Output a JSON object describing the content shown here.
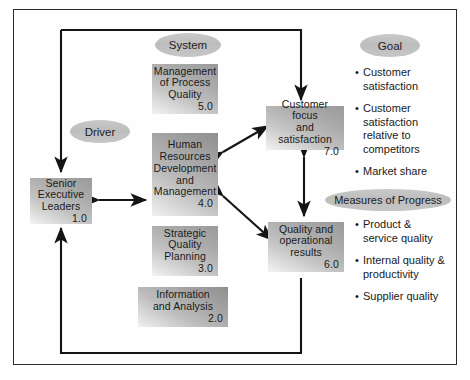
{
  "diagram": {
    "frame_border_color": "#2b2b2b",
    "box_fill": "#b0b0b0",
    "ellipse_fill": "#c2c2c2",
    "line_color": "#1a1a1a"
  },
  "labels": {
    "driver": "Driver",
    "system": "System",
    "goal": "Goal",
    "measures": "Measures of Progress"
  },
  "boxes": [
    {
      "id": "senior-executive-leaders",
      "title": "Senior\nExecutive\nLeaders",
      "lines": [
        "Senior",
        "Executive",
        "Leaders"
      ],
      "number": "1.0"
    },
    {
      "id": "management-of-process-quality",
      "lines": [
        "Management",
        "of Process",
        "Quality"
      ],
      "number": "5.0"
    },
    {
      "id": "human-resources-development-and-management",
      "lines": [
        "Human",
        "Resources",
        "Development",
        "and",
        "Management"
      ],
      "number": "4.0"
    },
    {
      "id": "strategic-quality-planning",
      "lines": [
        "Strategic",
        "Quality",
        "Planning"
      ],
      "number": "3.0"
    },
    {
      "id": "information-and-analysis",
      "lines": [
        "Information",
        "and Analysis"
      ],
      "number": "2.0"
    },
    {
      "id": "customer-focus-and-satisfaction",
      "lines": [
        "Customer focus",
        "and satisfaction"
      ],
      "number": "7.0"
    },
    {
      "id": "quality-and-operational-results",
      "lines": [
        "Quality and",
        "operational",
        "results"
      ],
      "number": "6.0"
    }
  ],
  "goal_bullets": [
    "Customer\nsatisfaction",
    "Customer\nsatisfaction\nrelative to\ncompetitors",
    "Market share"
  ],
  "goal_bullets_lines": [
    [
      "Customer",
      "satisfaction"
    ],
    [
      "Customer",
      "satisfaction",
      "relative to",
      "competitors"
    ],
    [
      "Market share"
    ]
  ],
  "measures_bullets_lines": [
    [
      "Product &",
      "service quality"
    ],
    [
      "Internal quality &",
      "productivity"
    ],
    [
      "Supplier quality"
    ]
  ],
  "bullet_marker": "•"
}
